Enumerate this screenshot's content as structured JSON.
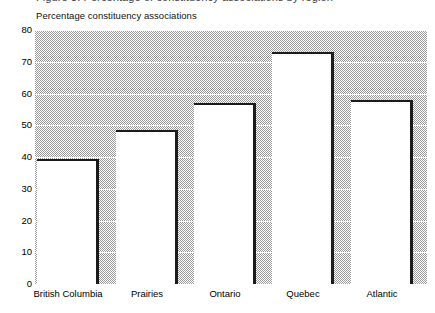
{
  "figure": {
    "clipped_title": "Figure 3: Percentage of constituency associations by region",
    "caption": "Percentage constituency associations"
  },
  "chart_data": {
    "type": "bar",
    "title": "Percentage constituency associations",
    "xlabel": "",
    "ylabel": "Percentage constituency associations",
    "categories": [
      "British Columbia",
      "Prairies",
      "Ontario",
      "Quebec",
      "Atlantic"
    ],
    "values": [
      39.5,
      48.5,
      57,
      73,
      58
    ],
    "ylim": [
      0,
      80
    ],
    "ytick_step": 10,
    "yticks": [
      80,
      70,
      60,
      50,
      40,
      30,
      20,
      10,
      0
    ],
    "ytick_labels": [
      "80",
      "70",
      "60",
      "50",
      "40",
      "30",
      "20",
      "10",
      "0"
    ],
    "grid": true,
    "grid_orientation": "horizontal",
    "grid_color": "#ffffff",
    "legend": false,
    "legend_position": "none",
    "plot_background": "#9a9a9a",
    "bar_fill_color": "#ffffff",
    "bar_edge_color": "#1b1b1b"
  }
}
